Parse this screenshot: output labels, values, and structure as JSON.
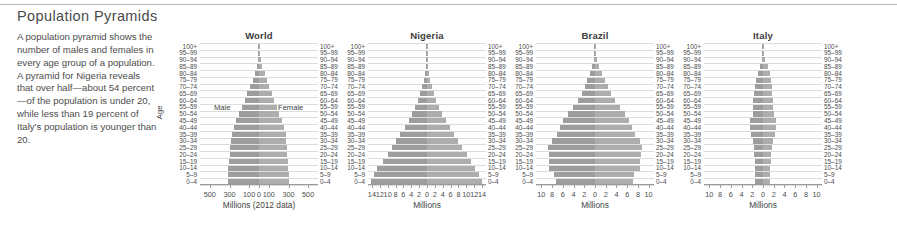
{
  "header": {
    "title": "Population Pyramids"
  },
  "blurb": {
    "text": "A population pyramid shows the number of males and females in every age group of a population. A pyramid for Nigeria reveals that over half—about 54 percent—of the population is under 20, while less than 19 percent of Italy's population is younger than 20."
  },
  "axis": {
    "y_title": "Age",
    "age_groups": [
      "100+",
      "95–99",
      "90–94",
      "85–89",
      "80–84",
      "75–79",
      "70–74",
      "65–69",
      "60–64",
      "55–59",
      "50–54",
      "45–49",
      "40–44",
      "35–39",
      "30–34",
      "25–29",
      "20–24",
      "15–19",
      "10–14",
      "5–9",
      "0–4"
    ]
  },
  "legend": {
    "male_label": "Male",
    "female_label": "Female"
  },
  "colors": {
    "male_bar": "#9d9d9d",
    "female_bar": "#adadad",
    "gridline": "#dcdcdc",
    "axis": "#9b9b9b",
    "rule": "#b9b9b9",
    "text": "#4d4d4d"
  },
  "chart_data": [
    {
      "type": "bar",
      "orientation": "population-pyramid",
      "title": "World",
      "xlabel": "Millions (2012 data)",
      "ylabel": "Age",
      "xlim": [
        -600,
        600
      ],
      "xticks": [
        -500,
        -300,
        -100,
        0,
        100,
        300,
        500
      ],
      "xticklabels": [
        "500",
        "300",
        "100",
        "0",
        "100",
        "300",
        "500"
      ],
      "grid": true,
      "categories": [
        "100+",
        "95–99",
        "90–94",
        "85–89",
        "80–84",
        "75–79",
        "70–74",
        "65–69",
        "60–64",
        "55–59",
        "50–54",
        "45–49",
        "40–44",
        "35–39",
        "30–34",
        "25–29",
        "20–24",
        "15–19",
        "10–14",
        "5–9",
        "0–4"
      ],
      "series": [
        {
          "name": "Male",
          "values": [
            1,
            4,
            11,
            23,
            42,
            65,
            92,
            118,
            145,
            172,
            203,
            232,
            256,
            277,
            283,
            290,
            298,
            307,
            313,
            317,
            318
          ]
        },
        {
          "name": "Female",
          "values": [
            2,
            8,
            19,
            34,
            56,
            80,
            105,
            128,
            153,
            178,
            206,
            233,
            255,
            274,
            279,
            284,
            288,
            293,
            298,
            302,
            303
          ]
        }
      ]
    },
    {
      "type": "bar",
      "orientation": "population-pyramid",
      "title": "Nigeria",
      "xlabel": "Millions",
      "ylabel": "Age",
      "xlim": [
        -15,
        15
      ],
      "xticks": [
        -14,
        -12,
        -10,
        -8,
        -6,
        -4,
        -2,
        0,
        2,
        4,
        6,
        8,
        10,
        12,
        14
      ],
      "xticklabels": [
        "14",
        "12",
        "10",
        "8",
        "6",
        "4",
        "2",
        "0",
        "2",
        "4",
        "6",
        "8",
        "10",
        "12",
        "14"
      ],
      "grid": true,
      "categories": [
        "100+",
        "95–99",
        "90–94",
        "85–89",
        "80–84",
        "75–79",
        "70–74",
        "65–69",
        "60–64",
        "55–59",
        "50–54",
        "45–49",
        "40–44",
        "35–39",
        "30–34",
        "25–29",
        "20–24",
        "15–19",
        "10–14",
        "5–9",
        "0–4"
      ],
      "series": [
        {
          "name": "Male",
          "values": [
            0.02,
            0.06,
            0.14,
            0.3,
            0.5,
            0.8,
            1.2,
            1.7,
            2.3,
            3.0,
            3.8,
            4.7,
            5.7,
            6.8,
            7.9,
            8.8,
            10.0,
            11.3,
            12.6,
            13.4,
            14.3
          ]
        },
        {
          "name": "Female",
          "values": [
            0.02,
            0.07,
            0.16,
            0.33,
            0.55,
            0.85,
            1.3,
            1.8,
            2.4,
            3.1,
            3.9,
            4.8,
            5.8,
            6.9,
            8.0,
            8.9,
            10.1,
            11.2,
            12.3,
            13.1,
            13.9
          ]
        }
      ]
    },
    {
      "type": "bar",
      "orientation": "population-pyramid",
      "title": "Brazil",
      "xlabel": "Millions",
      "ylabel": "Age",
      "xlim": [
        -11,
        11
      ],
      "xticks": [
        -10,
        -8,
        -6,
        -4,
        -2,
        0,
        2,
        4,
        6,
        8,
        10
      ],
      "xticklabels": [
        "10",
        "8",
        "6",
        "4",
        "2",
        "0",
        "2",
        "4",
        "6",
        "8",
        "10"
      ],
      "grid": true,
      "categories": [
        "100+",
        "95–99",
        "90–94",
        "85–89",
        "80–84",
        "75–79",
        "70–74",
        "65–69",
        "60–64",
        "55–59",
        "50–54",
        "45–49",
        "40–44",
        "35–39",
        "30–34",
        "25–29",
        "20–24",
        "15–19",
        "10–14",
        "5–9",
        "0–4"
      ],
      "series": [
        {
          "name": "Male",
          "values": [
            0.02,
            0.1,
            0.25,
            0.5,
            0.9,
            1.4,
            1.9,
            2.5,
            3.2,
            4.1,
            5.1,
            6.0,
            6.6,
            7.1,
            8.1,
            8.7,
            8.6,
            8.6,
            8.6,
            7.6,
            7.3
          ]
        },
        {
          "name": "Female",
          "values": [
            0.04,
            0.18,
            0.4,
            0.75,
            1.25,
            1.8,
            2.4,
            3.0,
            3.7,
            4.6,
            5.6,
            6.4,
            6.9,
            7.4,
            8.3,
            8.8,
            8.6,
            8.4,
            8.3,
            7.3,
            7.0
          ]
        }
      ]
    },
    {
      "type": "bar",
      "orientation": "population-pyramid",
      "title": "Italy",
      "xlabel": "Millions",
      "ylabel": "Age",
      "xlim": [
        -11,
        11
      ],
      "xticks": [
        -10,
        -8,
        -6,
        -4,
        -2,
        0,
        2,
        4,
        6,
        8,
        10
      ],
      "xticklabels": [
        "10",
        "8",
        "6",
        "4",
        "2",
        "0",
        "2",
        "4",
        "6",
        "8",
        "10"
      ],
      "grid": true,
      "categories": [
        "100+",
        "95–99",
        "90–94",
        "85–89",
        "80–84",
        "75–79",
        "70–74",
        "65–69",
        "60–64",
        "55–59",
        "50–54",
        "45–49",
        "40–44",
        "35–39",
        "30–34",
        "25–29",
        "20–24",
        "15–19",
        "10–14",
        "5–9",
        "0–4"
      ],
      "series": [
        {
          "name": "Male",
          "values": [
            0.01,
            0.06,
            0.22,
            0.55,
            0.95,
            1.25,
            1.4,
            1.6,
            1.85,
            1.85,
            1.95,
            2.35,
            2.45,
            2.25,
            1.95,
            1.75,
            1.6,
            1.45,
            1.4,
            1.4,
            1.4
          ]
        },
        {
          "name": "Female",
          "values": [
            0.03,
            0.16,
            0.45,
            0.9,
            1.35,
            1.55,
            1.6,
            1.75,
            1.95,
            1.95,
            2.05,
            2.4,
            2.45,
            2.2,
            1.9,
            1.7,
            1.55,
            1.4,
            1.35,
            1.35,
            1.35
          ]
        }
      ]
    }
  ]
}
